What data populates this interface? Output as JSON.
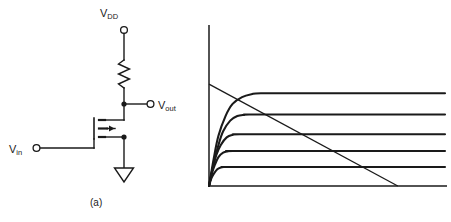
{
  "figure": {
    "stroke_color": "#1a1a1a",
    "background_color": "#ffffff",
    "width": 451,
    "height": 222
  },
  "panel_a": {
    "caption": "(a)",
    "description": "NMOS common-source inverter with resistor pull-up",
    "labels": {
      "vdd_main": "V",
      "vdd_sub": "DD",
      "vout_main": "V",
      "vout_sub": "out",
      "vin_main": "V",
      "vin_sub": "in"
    },
    "components": [
      {
        "name": "supply-terminal",
        "type": "open-circle-terminal",
        "label": "V_DD"
      },
      {
        "name": "load-resistor",
        "type": "zigzag-resistor"
      },
      {
        "name": "output-node",
        "type": "solid-junction-dot"
      },
      {
        "name": "output-terminal",
        "type": "open-circle-terminal",
        "label": "V_out"
      },
      {
        "name": "nmos-transistor",
        "type": "enhancement-nmos"
      },
      {
        "name": "input-terminal",
        "type": "open-circle-terminal",
        "label": "V_in"
      },
      {
        "name": "ground-symbol",
        "type": "triangle-ground"
      }
    ]
  },
  "panel_b": {
    "caption": "(b)",
    "description": "Family of drain current vs drain-source voltage curves intersected by a resistive load line"
  },
  "chart_data": {
    "type": "line",
    "title": "",
    "xlabel": "",
    "ylabel": "",
    "xlim": [
      0,
      100
    ],
    "ylim": [
      0,
      100
    ],
    "grid": false,
    "legend": "none",
    "axes": {
      "origin_px": [
        209,
        186
      ],
      "y_axis_top_px": 25,
      "x_axis_right_px": 447,
      "style": "two-axis L-frame, no ticks, no tick labels"
    },
    "series": [
      {
        "name": "curve-1",
        "note": "highest gate drive, saturates first and highest",
        "knee_x": 22,
        "plateau_y": 61,
        "points": [
          [
            0,
            0
          ],
          [
            2,
            18
          ],
          [
            4,
            33
          ],
          [
            7,
            46
          ],
          [
            10,
            54
          ],
          [
            14,
            58.5
          ],
          [
            18,
            60.4
          ],
          [
            22,
            61
          ],
          [
            40,
            61
          ],
          [
            70,
            61
          ],
          [
            100,
            61
          ]
        ]
      },
      {
        "name": "curve-2",
        "knee_x": 17,
        "plateau_y": 47,
        "points": [
          [
            0,
            0
          ],
          [
            2,
            15
          ],
          [
            4,
            27
          ],
          [
            6,
            36
          ],
          [
            9,
            43
          ],
          [
            12,
            46
          ],
          [
            15,
            46.8
          ],
          [
            17,
            47
          ],
          [
            40,
            47
          ],
          [
            70,
            47
          ],
          [
            100,
            47
          ]
        ]
      },
      {
        "name": "curve-3",
        "knee_x": 13,
        "plateau_y": 34,
        "points": [
          [
            0,
            0
          ],
          [
            1.5,
            11
          ],
          [
            3,
            20
          ],
          [
            5,
            27
          ],
          [
            7.5,
            32
          ],
          [
            10,
            33.6
          ],
          [
            13,
            34
          ],
          [
            40,
            34
          ],
          [
            70,
            34
          ],
          [
            100,
            34
          ]
        ]
      },
      {
        "name": "curve-4",
        "knee_x": 10,
        "plateau_y": 23,
        "points": [
          [
            0,
            0
          ],
          [
            1.2,
            8
          ],
          [
            2.5,
            14
          ],
          [
            4,
            19
          ],
          [
            6,
            22
          ],
          [
            8,
            22.8
          ],
          [
            10,
            23
          ],
          [
            40,
            23
          ],
          [
            70,
            23
          ],
          [
            100,
            23
          ]
        ]
      },
      {
        "name": "curve-5",
        "note": "lowest gate drive",
        "knee_x": 8,
        "plateau_y": 12.5,
        "points": [
          [
            0,
            0
          ],
          [
            1,
            5
          ],
          [
            2,
            8
          ],
          [
            3.5,
            11
          ],
          [
            5,
            12.2
          ],
          [
            6.5,
            12.5
          ],
          [
            8,
            12.5
          ],
          [
            40,
            12.5
          ],
          [
            70,
            12.5
          ],
          [
            100,
            12.5
          ]
        ]
      }
    ],
    "load_line": {
      "name": "resistive-load-line",
      "type": "straight",
      "from": [
        0,
        67
      ],
      "to": [
        80,
        0
      ],
      "note": "intersects every drain curve; meets y-axis near top and x-axis before right edge"
    }
  }
}
